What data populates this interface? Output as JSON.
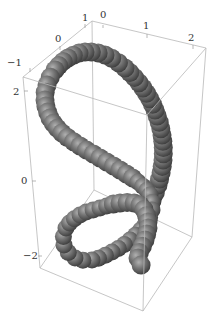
{
  "chart_data": {
    "type": "3d-tube-plot",
    "title": "",
    "colors": {
      "tube": "#6e6e6e",
      "tube_highlight": "#a8a8a8",
      "tube_shadow": "#3a3a3a",
      "box": "#b8b8b8"
    },
    "axes": {
      "x": {
        "ticks": [
          "-1",
          "0",
          "1"
        ]
      },
      "y": {
        "ticks": [
          "0",
          "1",
          "2"
        ]
      },
      "z": {
        "ticks": [
          "2",
          "0",
          "-2"
        ]
      }
    }
  },
  "labels": {
    "x_tick_neg1": "−1",
    "x_tick_0": "0",
    "x_tick_1": "1",
    "y_tick_0": "0",
    "y_tick_1": "1",
    "y_tick_2": "2",
    "z_tick_2": "2",
    "z_tick_0": "0",
    "z_tick_neg2": "−2"
  }
}
